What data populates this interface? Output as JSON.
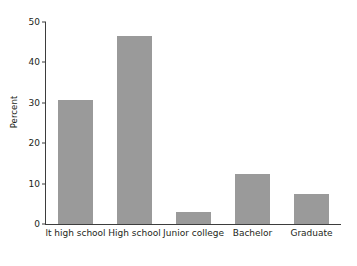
{
  "chart_data": {
    "type": "bar",
    "title": "",
    "subtitle": "",
    "xlabel": "",
    "ylabel": "Percent",
    "categories": [
      "lt high school",
      "High school",
      "Junior college",
      "Bachelor",
      "Graduate"
    ],
    "values": [
      30.6,
      46.5,
      3.0,
      12.5,
      7.4
    ],
    "ylim": [
      0,
      52
    ],
    "yticks": [
      0,
      10,
      20,
      30,
      40,
      50
    ],
    "ytick_labels": [
      "0",
      "10",
      "20",
      "30",
      "40",
      "50"
    ],
    "grid": false,
    "legend": false,
    "legend_position": "none",
    "bar_color": "#9a9a9a",
    "axis_color": "#3d3d3d",
    "background_color": "#ffffff",
    "text_color": "#231f20"
  }
}
